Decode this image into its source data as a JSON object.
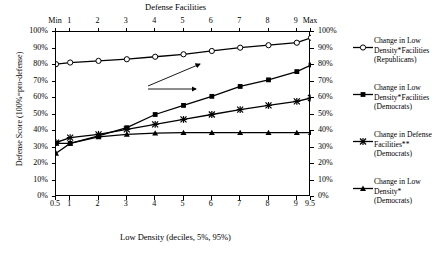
{
  "chart_data": {
    "type": "line",
    "title": "",
    "xlabel": "Low Density (deciles, 5%, 95%)",
    "xlabel_top": "Defense Facilities",
    "ylabel": "Defense Score (100%=pro-defense)",
    "x": [
      0.5,
      1,
      2,
      3,
      4,
      5,
      6,
      7,
      8,
      9,
      9.5
    ],
    "xtick_labels_bottom": [
      "0.5",
      "1",
      "2",
      "3",
      "4",
      "5",
      "6",
      "7",
      "8",
      "9",
      "9.5"
    ],
    "xtick_labels_top": [
      "Min",
      "1",
      "2",
      "3",
      "4",
      "5",
      "6",
      "7",
      "8",
      "9",
      "Max"
    ],
    "ytick_labels": [
      "0%",
      "10%",
      "20%",
      "30%",
      "40%",
      "50%",
      "60%",
      "70%",
      "80%",
      "90%",
      "100%"
    ],
    "ytick_labels_right": [
      "0%",
      "10%",
      "20%",
      "30%",
      "40%",
      "50%",
      "60%",
      "70%",
      "80%",
      "90%",
      "100%"
    ],
    "ylim": [
      0,
      100
    ],
    "grid": false,
    "legend_position": "right",
    "annotation": {
      "text_line1": "Economic",
      "text_line2": "Reliance"
    },
    "series": [
      {
        "name": "Change in Low Density*Facilities (Republicans)",
        "legend_label_lines": [
          "Change in Low",
          "Density*Facilities",
          "(Republicans)"
        ],
        "marker": "open-circle",
        "values": [
          80.5,
          81.5,
          82.5,
          83.5,
          85.0,
          86.5,
          88.5,
          90.5,
          92.0,
          93.5,
          96.5
        ]
      },
      {
        "name": "Change in Low Density*Facilities (Democrats)",
        "legend_label_lines": [
          "Change in Low",
          "Density*Facilities",
          "(Democrats)"
        ],
        "marker": "filled-square",
        "values": [
          32.5,
          32.5,
          37.0,
          42.0,
          50.0,
          55.5,
          61.0,
          67.0,
          71.0,
          76.0,
          80.0
        ]
      },
      {
        "name": "Change in Defense Facilities** (Democrats)",
        "legend_label_lines": [
          "Change in Defense",
          "Facilities**",
          "(Democrats)"
        ],
        "marker": "x-cross",
        "values": [
          33.0,
          36.0,
          38.0,
          41.0,
          44.0,
          47.0,
          50.0,
          53.0,
          55.5,
          58.0,
          60.0
        ]
      },
      {
        "name": "Change in Low Density* (Democrats)",
        "legend_label_lines": [
          "Change in Low",
          "Density*",
          "(Democrats)"
        ],
        "marker": "filled-triangle",
        "values": [
          26.5,
          32.5,
          36.5,
          38.0,
          38.7,
          39.0,
          39.0,
          39.0,
          39.0,
          39.0,
          39.0
        ]
      }
    ]
  }
}
